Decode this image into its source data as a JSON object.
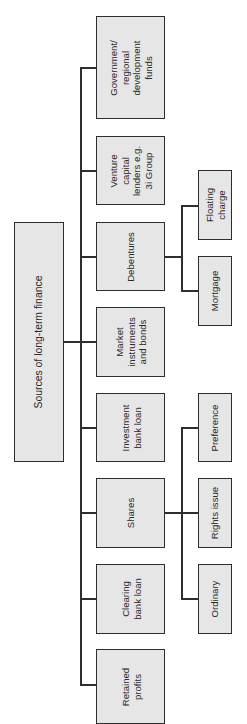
{
  "diagram": {
    "type": "tree",
    "orientation": "rotated-90-ccw",
    "root": {
      "id": "root",
      "label": "Sources of long-term finance"
    },
    "children": [
      {
        "id": "government",
        "label": "Government/\nregional\ndevelopment\nfunds",
        "children": []
      },
      {
        "id": "venture",
        "label": "Venture\ncapital\nlenders e.g.\n3i Group",
        "children": []
      },
      {
        "id": "debentures",
        "label": "Debentures",
        "children": [
          {
            "id": "floating",
            "label": "Floating\ncharge"
          },
          {
            "id": "mortgage",
            "label": "Mortgage"
          }
        ]
      },
      {
        "id": "market",
        "label": "Market\ninstruments\nand bonds",
        "children": []
      },
      {
        "id": "investment",
        "label": "Investment\nbank loan",
        "children": []
      },
      {
        "id": "shares",
        "label": "Shares",
        "children": [
          {
            "id": "preference",
            "label": "Preference"
          },
          {
            "id": "rights",
            "label": "Rights issue"
          },
          {
            "id": "ordinary",
            "label": "Ordinary"
          }
        ]
      },
      {
        "id": "clearing",
        "label": "Clearing\nbank loan",
        "children": []
      },
      {
        "id": "retained",
        "label": "Retained\nprofits",
        "children": []
      }
    ]
  },
  "colors": {
    "box_fill": "#e6e6e6",
    "border": "#2e2e2e",
    "text": "#2a2a2a",
    "background": "#ffffff"
  }
}
